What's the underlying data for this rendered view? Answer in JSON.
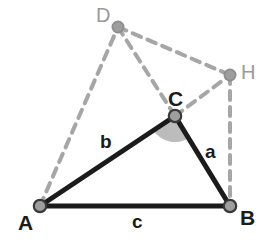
{
  "figure": {
    "canvas": {
      "width": 269,
      "height": 239,
      "background": "#ffffff"
    },
    "colors": {
      "solid_stroke": "#1b1b1b",
      "dashed_stroke": "#a6a6a6",
      "vertex_fill": "#9e9e9e",
      "vertex_stroke": "#3a3a3a",
      "angle_fill": "#b0b0b0",
      "label_dark": "#1b1b1b",
      "label_gray": "#9a9a9a"
    },
    "vertices": [
      {
        "id": "A",
        "label": "A",
        "x": 40,
        "y": 206,
        "style": "dark",
        "label_x": 18,
        "label_y": 212
      },
      {
        "id": "B",
        "label": "B",
        "x": 230,
        "y": 206,
        "style": "dark",
        "label_x": 240,
        "label_y": 207
      },
      {
        "id": "C",
        "label": "C",
        "x": 175,
        "y": 116,
        "style": "dark",
        "label_x": 168,
        "label_y": 88
      },
      {
        "id": "D",
        "label": "D",
        "x": 118,
        "y": 27,
        "style": "gray",
        "label_x": 96,
        "label_y": 5
      },
      {
        "id": "H",
        "label": "H",
        "x": 230,
        "y": 75,
        "style": "gray",
        "label_x": 241,
        "label_y": 62
      }
    ],
    "solid_edges": [
      {
        "id": "edge-ac",
        "from": "A",
        "to": "C",
        "side_label": "b"
      },
      {
        "id": "edge-cb",
        "from": "C",
        "to": "B",
        "side_label": "a"
      },
      {
        "id": "edge-ab",
        "from": "A",
        "to": "B",
        "side_label": "c"
      }
    ],
    "dashed_edges": [
      {
        "id": "edge-ad",
        "from": "A",
        "to": "D"
      },
      {
        "id": "edge-dc",
        "from": "D",
        "to": "C"
      },
      {
        "id": "edge-dh",
        "from": "D",
        "to": "H"
      },
      {
        "id": "edge-ch",
        "from": "C",
        "to": "H"
      },
      {
        "id": "edge-hb",
        "from": "H",
        "to": "B"
      }
    ],
    "side_labels": [
      {
        "id": "side-b",
        "text": "b",
        "x": 100,
        "y": 132
      },
      {
        "id": "side-a",
        "text": "a",
        "x": 205,
        "y": 142
      },
      {
        "id": "side-c",
        "text": "c",
        "x": 132,
        "y": 212
      }
    ],
    "angle_marker": {
      "id": "angle-c",
      "at_vertex": "C",
      "radius": 26,
      "fill": "#b0b0b0",
      "opacity": 0.85
    }
  }
}
